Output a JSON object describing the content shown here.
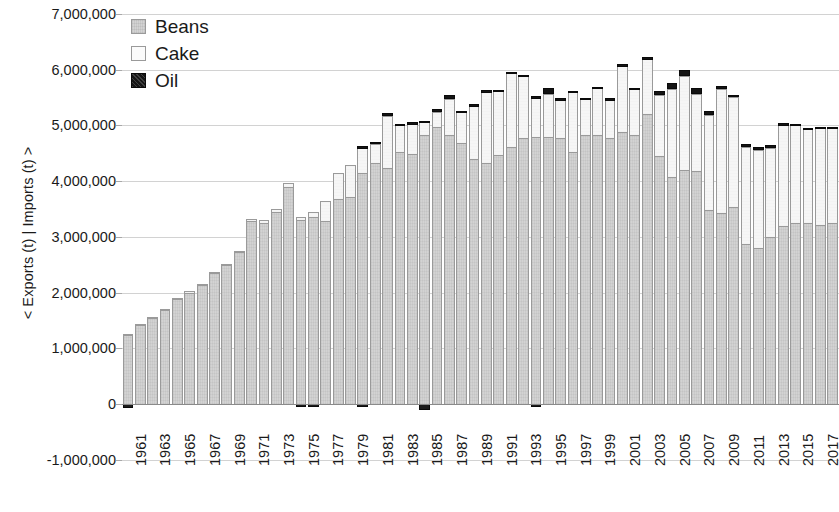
{
  "chart_data": {
    "type": "bar",
    "subtype": "stacked-bar",
    "title": "",
    "xlabel": "",
    "ylabel": "< Exports (t) | Imports (t) >",
    "ylim": [
      -1000000,
      7000000
    ],
    "ytick_values": [
      7000000,
      6000000,
      5000000,
      4000000,
      3000000,
      2000000,
      1000000,
      0,
      -1000000
    ],
    "ytick_labels": [
      "7,000,000",
      "6,000,000",
      "5,000,000",
      "4,000,000",
      "3,000,000",
      "2,000,000",
      "1,000,000",
      "0",
      "-1,000,000"
    ],
    "grid": true,
    "legend_position": "top-left",
    "legend": [
      "Beans",
      "Cake",
      "Oil"
    ],
    "series_colors": {
      "Beans": "#d3d3d3",
      "Cake": "#f6f6f6",
      "Oil": "#141414"
    },
    "x": [
      1961,
      1962,
      1963,
      1964,
      1965,
      1966,
      1967,
      1968,
      1969,
      1970,
      1971,
      1972,
      1973,
      1974,
      1975,
      1976,
      1977,
      1978,
      1979,
      1980,
      1981,
      1982,
      1983,
      1984,
      1985,
      1986,
      1987,
      1988,
      1989,
      1990,
      1991,
      1992,
      1993,
      1994,
      1995,
      1996,
      1997,
      1998,
      1999,
      2000,
      2001,
      2002,
      2003,
      2004,
      2005,
      2006,
      2007,
      2008,
      2009,
      2010,
      2011,
      2012,
      2013,
      2014,
      2015,
      2016,
      2017,
      2018
    ],
    "xtick_labels": [
      "1961",
      "1963",
      "1965",
      "1967",
      "1969",
      "1971",
      "1973",
      "1975",
      "1977",
      "1979",
      "1981",
      "1983",
      "1985",
      "1987",
      "1989",
      "1991",
      "1993",
      "1995",
      "1997",
      "1999",
      "2001",
      "2003",
      "2005",
      "2007",
      "2009",
      "2011",
      "2013",
      "2015",
      "2017"
    ],
    "xtick_interval": 2,
    "series": [
      {
        "name": "Beans",
        "values": [
          1240000,
          1420000,
          1540000,
          1680000,
          1880000,
          2000000,
          2140000,
          2350000,
          2500000,
          2720000,
          3280000,
          3250000,
          3450000,
          3900000,
          3300000,
          3350000,
          3280000,
          3680000,
          3720000,
          4150000,
          4330000,
          4230000,
          4530000,
          4480000,
          4820000,
          4980000,
          4830000,
          4680000,
          4400000,
          4330000,
          4470000,
          4620000,
          4780000,
          4790000,
          4800000,
          4770000,
          4530000,
          4830000,
          4820000,
          4780000,
          4880000,
          4830000,
          5200000,
          4450000,
          4080000,
          4200000,
          4190000,
          3480000,
          3430000,
          3530000,
          2880000,
          2800000,
          3000000,
          3200000,
          3240000,
          3250000,
          3210000,
          3250000
        ]
      },
      {
        "name": "Cake",
        "values": [
          20000,
          20000,
          20000,
          20000,
          20000,
          20000,
          20000,
          20000,
          20000,
          30000,
          40000,
          50000,
          50000,
          60000,
          50000,
          100000,
          370000,
          470000,
          570000,
          440000,
          340000,
          940000,
          480000,
          560000,
          240000,
          260000,
          640000,
          560000,
          960000,
          1280000,
          1150000,
          1320000,
          1110000,
          710000,
          770000,
          700000,
          1070000,
          650000,
          850000,
          690000,
          1200000,
          830000,
          1000000,
          1090000,
          1580000,
          1680000,
          1380000,
          1700000,
          2230000,
          1980000,
          1740000,
          1760000,
          1600000,
          1800000,
          1760000,
          1680000,
          1740000,
          1700000
        ]
      },
      {
        "name": "Oil",
        "values": [
          0,
          0,
          0,
          0,
          0,
          0,
          0,
          0,
          0,
          0,
          0,
          0,
          0,
          0,
          0,
          0,
          0,
          0,
          0,
          40000,
          40000,
          60000,
          20000,
          20000,
          20000,
          50000,
          80000,
          20000,
          20000,
          20000,
          20000,
          20000,
          20000,
          20000,
          110000,
          20000,
          20000,
          20000,
          20000,
          20000,
          20000,
          20000,
          20000,
          70000,
          110000,
          110000,
          110000,
          80000,
          50000,
          40000,
          40000,
          60000,
          40000,
          40000,
          30000,
          30000,
          30000,
          30000
        ]
      },
      {
        "name": "Imports",
        "values": [
          -70000,
          0,
          0,
          0,
          0,
          0,
          0,
          0,
          0,
          0,
          0,
          0,
          0,
          0,
          -50000,
          -40000,
          0,
          0,
          0,
          -50000,
          0,
          0,
          0,
          0,
          -100000,
          0,
          0,
          0,
          0,
          0,
          0,
          0,
          0,
          -60000,
          0,
          0,
          0,
          0,
          0,
          0,
          0,
          0,
          0,
          0,
          0,
          0,
          0,
          0,
          0,
          0,
          0,
          0,
          0,
          0,
          0,
          0,
          0,
          0
        ]
      }
    ]
  },
  "axis": {
    "y_title": "< Exports (t) | Imports (t) >"
  },
  "legend": {
    "items": [
      {
        "label": "Beans",
        "swatch": "beans-swatch"
      },
      {
        "label": "Cake",
        "swatch": "cake-swatch"
      },
      {
        "label": "Oil",
        "swatch": "oil-swatch"
      }
    ]
  }
}
